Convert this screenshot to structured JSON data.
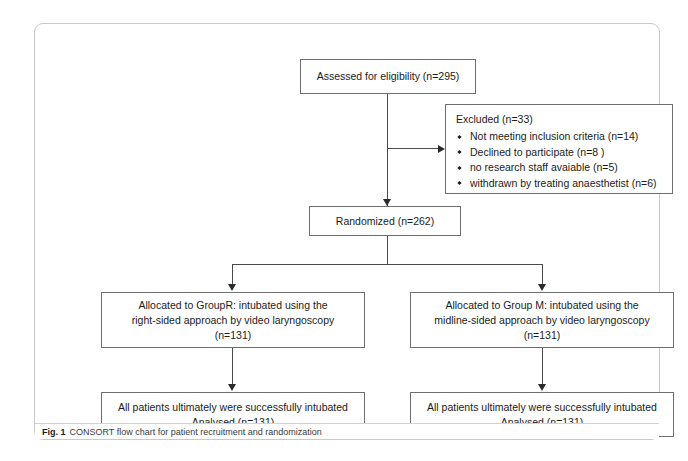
{
  "chart_data": {
    "type": "diagram",
    "title": "CONSORT flow chart for patient recruitment and randomization",
    "nodes": [
      {
        "id": "assessed",
        "label": "Assessed for eligibility (n=295)",
        "n": 295
      },
      {
        "id": "excluded",
        "label": "Excluded  (n=33)",
        "n": 33
      },
      {
        "id": "randomized",
        "label": "Randomized (n=262)",
        "n": 262
      },
      {
        "id": "alloc_right_group",
        "label": "Allocated to GroupR: intubated using the right-sided approach by video laryngoscopy (n=131)",
        "n": 131
      },
      {
        "id": "alloc_midline_group",
        "label": "Allocated to Group M: intubated using the midline-sided approach by video laryngoscopy (n=131)",
        "n": 131
      },
      {
        "id": "outcome_left",
        "label": "All patients ultimately were successfully intubated Analysed  (n=131)",
        "n": 131
      },
      {
        "id": "outcome_right",
        "label": "All patients ultimately were successfully intubated Analysed  (n=131)",
        "n": 131
      }
    ],
    "exclusion_reasons": [
      {
        "reason": "Not meeting inclusion criteria",
        "n": 14
      },
      {
        "reason": "Declined to participate",
        "n": 8
      },
      {
        "reason": "no research staff avaiable",
        "n": 5
      },
      {
        "reason": "withdrawn by treating anaesthetist",
        "n": 6
      }
    ],
    "edges": [
      {
        "from": "assessed",
        "to": "randomized"
      },
      {
        "from": "assessed",
        "to": "excluded"
      },
      {
        "from": "randomized",
        "to": "alloc_right_group"
      },
      {
        "from": "randomized",
        "to": "alloc_midline_group"
      },
      {
        "from": "alloc_right_group",
        "to": "outcome_left"
      },
      {
        "from": "alloc_midline_group",
        "to": "outcome_right"
      }
    ]
  },
  "boxes": {
    "assessed": {
      "line1": "Assessed for eligibility (n=295)"
    },
    "excluded": {
      "title": "Excluded  (n=33)",
      "items": [
        "Not meeting inclusion criteria (n=14)",
        "Declined to participate (n=8 )",
        "no research staff avaiable (n=5)",
        "withdrawn by treating anaesthetist (n=6)"
      ]
    },
    "randomized": {
      "line1": "Randomized (n=262)"
    },
    "alloc_left": {
      "line1": "Allocated to GroupR: intubated using the",
      "line2": "right-sided approach by video laryngoscopy",
      "line3": "(n=131)"
    },
    "alloc_right": {
      "line1": "Allocated to Group M: intubated using the",
      "line2": "midline-sided approach by video laryngoscopy",
      "line3": "(n=131)"
    },
    "outcome_left": {
      "line1": "All patients ultimately were successfully intubated",
      "line2": "Analysed  (n=131)"
    },
    "outcome_right": {
      "line1": "All patients ultimately were successfully intubated",
      "line2": "Analysed  (n=131)"
    }
  },
  "caption": {
    "label": "Fig. 1",
    "text": "CONSORT flow chart for patient recruitment and randomization"
  },
  "colors": {
    "box_border": "#6e6e6e",
    "connector": "#4a4a4a",
    "frame_border": "#c9c9c9",
    "text": "#1b1b1b",
    "background": "#ffffff"
  }
}
